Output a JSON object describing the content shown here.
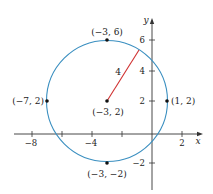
{
  "figure": {
    "type": "circle-on-coordinate-plane",
    "axes": {
      "x_label": "x",
      "y_label": "y",
      "x_ticks": [
        {
          "value": -8,
          "label": "−8"
        },
        {
          "value": -6,
          "label": ""
        },
        {
          "value": -4,
          "label": "−4"
        },
        {
          "value": -2,
          "label": ""
        },
        {
          "value": 2,
          "label": "2"
        }
      ],
      "y_ticks": [
        {
          "value": -2,
          "label": "−2"
        },
        {
          "value": 2,
          "label": "2"
        },
        {
          "value": 4,
          "label": "4"
        },
        {
          "value": 6,
          "label": "6"
        }
      ]
    },
    "circle": {
      "center": [
        -3,
        2
      ],
      "radius": 4,
      "color": "#3a8fc0"
    },
    "radius_segment": {
      "label": "4",
      "color": "#d03030"
    },
    "points": [
      {
        "name": "center",
        "label": "(−3, 2)"
      },
      {
        "name": "top",
        "label": "(−3, 6)"
      },
      {
        "name": "bottom",
        "label": "(−3, −2)"
      },
      {
        "name": "left",
        "label": "(−7, 2)"
      },
      {
        "name": "right",
        "label": "(1, 2)"
      }
    ]
  }
}
